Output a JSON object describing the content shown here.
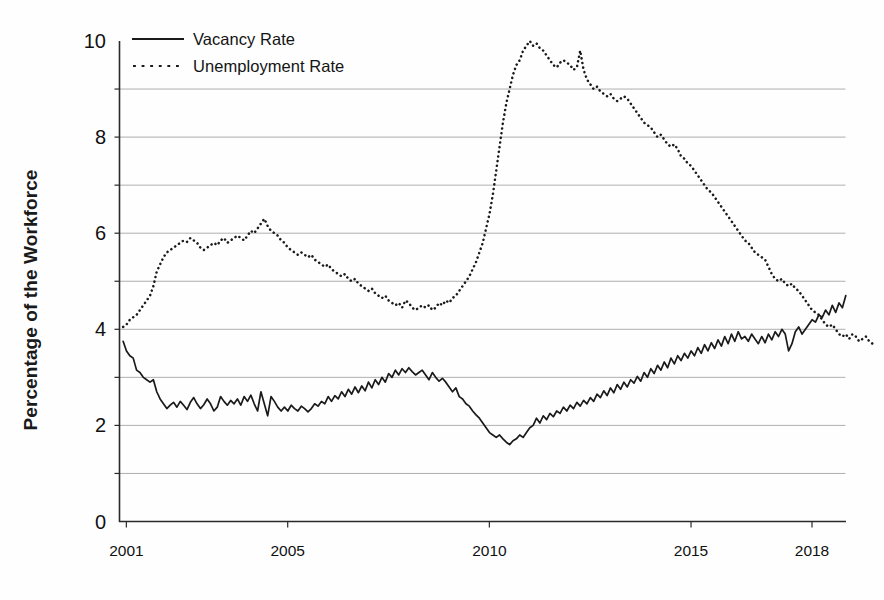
{
  "chart_data": {
    "type": "line",
    "title": "",
    "xlabel": "",
    "ylabel": "Percentage of the Workforce",
    "xlim": [
      2000.83,
      2018.83
    ],
    "ylim": [
      0,
      10
    ],
    "yticks": [
      0,
      2,
      4,
      6,
      8,
      10
    ],
    "xticks": [
      2001,
      2005,
      2010,
      2015,
      2018
    ],
    "xtick_labels": [
      "2001",
      "2005",
      "2010",
      "2015",
      "2018"
    ],
    "ytick_labels": [
      "0",
      "2",
      "4",
      "6",
      "8",
      "10"
    ],
    "grid": "horizontal-every-1-unit",
    "legend_position": "top-left-inside",
    "series": [
      {
        "name": "Vacancy Rate",
        "style": "solid",
        "color": "#1a1a1a",
        "x_start": 2000.92,
        "x_step": 0.08333,
        "values": [
          3.75,
          3.55,
          3.45,
          3.4,
          3.15,
          3.1,
          3.0,
          2.95,
          2.9,
          2.95,
          2.7,
          2.55,
          2.45,
          2.35,
          2.42,
          2.48,
          2.38,
          2.5,
          2.42,
          2.33,
          2.48,
          2.58,
          2.45,
          2.35,
          2.43,
          2.55,
          2.45,
          2.3,
          2.38,
          2.6,
          2.5,
          2.42,
          2.52,
          2.45,
          2.55,
          2.42,
          2.6,
          2.5,
          2.63,
          2.45,
          2.3,
          2.7,
          2.45,
          2.2,
          2.6,
          2.5,
          2.38,
          2.3,
          2.38,
          2.3,
          2.42,
          2.35,
          2.3,
          2.4,
          2.35,
          2.28,
          2.35,
          2.45,
          2.4,
          2.5,
          2.45,
          2.6,
          2.5,
          2.62,
          2.55,
          2.7,
          2.6,
          2.75,
          2.65,
          2.8,
          2.68,
          2.82,
          2.72,
          2.9,
          2.78,
          2.95,
          2.85,
          3.0,
          2.9,
          3.08,
          3.0,
          3.15,
          3.05,
          3.18,
          3.1,
          3.2,
          3.12,
          3.05,
          3.1,
          3.15,
          3.05,
          2.95,
          3.1,
          3.0,
          2.92,
          2.98,
          2.9,
          2.8,
          2.7,
          2.78,
          2.6,
          2.55,
          2.45,
          2.4,
          2.3,
          2.22,
          2.15,
          2.05,
          1.95,
          1.85,
          1.8,
          1.75,
          1.8,
          1.72,
          1.65,
          1.6,
          1.68,
          1.72,
          1.8,
          1.75,
          1.85,
          1.95,
          2.0,
          2.15,
          2.05,
          2.2,
          2.12,
          2.25,
          2.18,
          2.3,
          2.25,
          2.38,
          2.3,
          2.42,
          2.35,
          2.48,
          2.4,
          2.52,
          2.45,
          2.58,
          2.5,
          2.65,
          2.58,
          2.72,
          2.62,
          2.78,
          2.68,
          2.85,
          2.75,
          2.9,
          2.8,
          2.95,
          2.88,
          3.02,
          2.92,
          3.1,
          3.0,
          3.18,
          3.08,
          3.25,
          3.15,
          3.32,
          3.2,
          3.4,
          3.28,
          3.45,
          3.35,
          3.5,
          3.4,
          3.55,
          3.45,
          3.62,
          3.5,
          3.68,
          3.55,
          3.72,
          3.6,
          3.78,
          3.65,
          3.85,
          3.7,
          3.9,
          3.75,
          3.95,
          3.8,
          3.85,
          3.75,
          3.9,
          3.8,
          3.7,
          3.85,
          3.72,
          3.9,
          3.78,
          3.95,
          3.85,
          4.0,
          3.9,
          3.55,
          3.7,
          3.95,
          4.05,
          3.9,
          4.0,
          4.1,
          4.2,
          4.15,
          4.3,
          4.25,
          4.4,
          4.3,
          4.5,
          4.35,
          4.55,
          4.45,
          4.7
        ]
      },
      {
        "name": "Unemployment Rate",
        "style": "dotted",
        "color": "#1a1a1a",
        "x_start": 2000.92,
        "x_step": 0.08333,
        "values": [
          4.05,
          4.1,
          4.2,
          4.25,
          4.3,
          4.4,
          4.5,
          4.6,
          4.7,
          4.9,
          5.2,
          5.35,
          5.5,
          5.6,
          5.65,
          5.7,
          5.75,
          5.8,
          5.85,
          5.82,
          5.9,
          5.85,
          5.8,
          5.7,
          5.65,
          5.7,
          5.75,
          5.8,
          5.75,
          5.85,
          5.9,
          5.8,
          5.85,
          5.9,
          5.95,
          5.9,
          5.85,
          5.95,
          6.05,
          6.0,
          6.1,
          6.2,
          6.3,
          6.15,
          6.05,
          6.0,
          5.95,
          5.85,
          5.8,
          5.7,
          5.65,
          5.6,
          5.55,
          5.6,
          5.55,
          5.5,
          5.55,
          5.45,
          5.4,
          5.35,
          5.3,
          5.35,
          5.25,
          5.2,
          5.15,
          5.1,
          5.15,
          5.05,
          5.0,
          5.05,
          4.95,
          4.9,
          4.85,
          4.8,
          4.85,
          4.75,
          4.7,
          4.65,
          4.7,
          4.6,
          4.55,
          4.5,
          4.55,
          4.45,
          4.6,
          4.55,
          4.45,
          4.4,
          4.45,
          4.5,
          4.45,
          4.5,
          4.4,
          4.45,
          4.55,
          4.5,
          4.6,
          4.55,
          4.65,
          4.7,
          4.8,
          4.9,
          5.0,
          5.1,
          5.25,
          5.4,
          5.6,
          5.8,
          6.1,
          6.4,
          6.8,
          7.3,
          7.8,
          8.3,
          8.7,
          9.0,
          9.3,
          9.5,
          9.6,
          9.8,
          9.9,
          10.0,
          9.9,
          9.95,
          9.85,
          9.8,
          9.7,
          9.6,
          9.5,
          9.45,
          9.55,
          9.6,
          9.55,
          9.5,
          9.4,
          9.45,
          9.8,
          9.4,
          9.2,
          9.1,
          9.0,
          9.05,
          8.95,
          8.9,
          8.85,
          8.9,
          8.8,
          8.75,
          8.8,
          8.85,
          8.8,
          8.7,
          8.6,
          8.5,
          8.4,
          8.3,
          8.25,
          8.2,
          8.1,
          8.0,
          8.05,
          7.95,
          7.85,
          7.8,
          7.85,
          7.75,
          7.6,
          7.55,
          7.45,
          7.4,
          7.3,
          7.2,
          7.1,
          7.0,
          6.9,
          6.85,
          6.75,
          6.65,
          6.55,
          6.45,
          6.35,
          6.25,
          6.15,
          6.05,
          5.95,
          5.85,
          5.8,
          5.7,
          5.6,
          5.55,
          5.5,
          5.45,
          5.3,
          5.15,
          5.05,
          5.0,
          5.05,
          4.95,
          4.9,
          4.95,
          4.85,
          4.8,
          4.7,
          4.6,
          4.5,
          4.4,
          4.35,
          4.3,
          4.2,
          4.1,
          4.05,
          4.1,
          4.0,
          3.9,
          3.85,
          3.9,
          3.8,
          3.9,
          3.85,
          3.75,
          3.8,
          3.85,
          3.75,
          3.7
        ]
      }
    ]
  },
  "legend": {
    "items": [
      {
        "label": "Vacancy Rate",
        "style": "solid"
      },
      {
        "label": "Unemployment Rate",
        "style": "dotted"
      }
    ]
  },
  "axes": {
    "y_axis_title": "Percentage of the Workforce"
  }
}
